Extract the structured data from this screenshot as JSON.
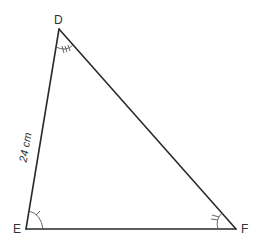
{
  "diagram": {
    "type": "triangle",
    "vertices": [
      {
        "label": "D",
        "x": 59,
        "y": 29
      },
      {
        "label": "E",
        "x": 26,
        "y": 229
      },
      {
        "label": "F",
        "x": 236,
        "y": 229
      }
    ],
    "sides": [
      {
        "from": "D",
        "to": "E",
        "label": "24 cm"
      }
    ],
    "angle_marks": [
      {
        "vertex": "D",
        "ticks": 3
      },
      {
        "vertex": "E",
        "ticks": 1
      },
      {
        "vertex": "F",
        "ticks": 2
      }
    ],
    "colors": {
      "stroke": "#2a2a2a",
      "text": "#333333",
      "background": "#ffffff"
    }
  }
}
